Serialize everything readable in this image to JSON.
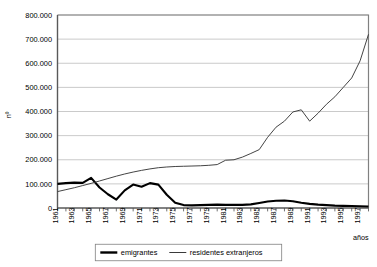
{
  "chart_data": {
    "type": "line",
    "title": "",
    "subtitle": "",
    "xlabel": "años",
    "ylabel": "nº",
    "grid": true,
    "legend_position": "bottom",
    "xlim": [
      1961,
      1998
    ],
    "ylim": [
      0,
      800000
    ],
    "ytick_labels": [
      "0",
      "100.000",
      "200.000",
      "300.000",
      "400.000",
      "500.000",
      "600.000",
      "700.000",
      "800.000"
    ],
    "ytick_values": [
      0,
      100000,
      200000,
      300000,
      400000,
      500000,
      600000,
      700000,
      800000
    ],
    "xtick_labels": [
      "1961",
      "1963",
      "1965",
      "1967",
      "1969",
      "1971",
      "1973",
      "1975",
      "1977",
      "1979",
      "1981",
      "1983",
      "1985",
      "1987",
      "1989",
      "1991",
      "1993",
      "1995",
      "1997"
    ],
    "x": [
      1961,
      1962,
      1963,
      1964,
      1965,
      1966,
      1967,
      1968,
      1969,
      1970,
      1971,
      1972,
      1973,
      1974,
      1975,
      1976,
      1977,
      1978,
      1979,
      1980,
      1981,
      1982,
      1983,
      1984,
      1985,
      1986,
      1987,
      1988,
      1989,
      1990,
      1991,
      1992,
      1993,
      1994,
      1995,
      1996,
      1997,
      1998
    ],
    "series": [
      {
        "name": "emigrantes",
        "color": "#000000",
        "style": "thick",
        "values": [
          100000,
          103000,
          105000,
          104000,
          125000,
          85000,
          57000,
          35000,
          73000,
          97000,
          88000,
          103000,
          97000,
          55000,
          22000,
          12000,
          11000,
          12000,
          13000,
          14000,
          13000,
          13000,
          13000,
          15000,
          21000,
          27000,
          30000,
          31000,
          28000,
          22000,
          17000,
          14000,
          12000,
          10000,
          9000,
          8000,
          7000,
          6000
        ]
      },
      {
        "name": "residentes extranjeros",
        "color": "#3a3a3a",
        "style": "thin",
        "values": [
          68000,
          76000,
          84000,
          93000,
          102000,
          112000,
          122000,
          132000,
          141000,
          149000,
          156000,
          162000,
          167000,
          170000,
          172000,
          173000,
          174000,
          175000,
          177000,
          180000,
          198000,
          200000,
          211000,
          226000,
          242000,
          293000,
          335000,
          360000,
          398000,
          407000,
          360000,
          393000,
          430000,
          461000,
          500000,
          539000,
          610000,
          720000
        ]
      }
    ],
    "legend": [
      "emigrantes",
      "residentes extranjeros"
    ]
  }
}
